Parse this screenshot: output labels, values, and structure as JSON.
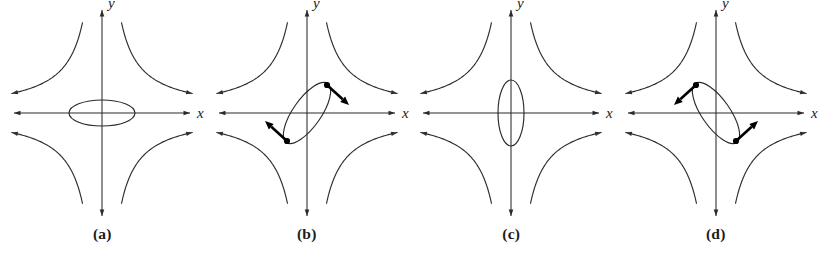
{
  "figure": {
    "kind": "phase-portrait-figure",
    "panel_count": 4,
    "background_color": "#ffffff",
    "stroke_color": "#2a2a2a",
    "accent_color": "#000000",
    "axis_label_x": "x",
    "axis_label_y": "y",
    "geometry": {
      "origin_x": 102,
      "origin_y": 113,
      "x_axis_half_length": 88,
      "y_axis_half_length": 103,
      "saddle_curve_scale": 42,
      "saddle_curve_extent": 2.15
    }
  },
  "panels": [
    {
      "id": "panel-a",
      "caption": "(a)",
      "ellipse": {
        "center_x": 0,
        "center_y": 0,
        "semi_major": 33,
        "semi_minor": 13,
        "rotation_deg": 0,
        "orientation": "horizontal"
      },
      "saddle_curves": true,
      "vectors": []
    },
    {
      "id": "panel-b",
      "caption": "(b)",
      "ellipse": {
        "center_x": 0,
        "center_y": 0,
        "semi_major": 36,
        "semi_minor": 14,
        "rotation_deg": -55,
        "orientation": "tilted-up-right"
      },
      "saddle_curves": true,
      "vectors": [
        {
          "name": "vector-upper-right",
          "point_x": 20,
          "point_y": 28,
          "dx": 22,
          "dy": -20,
          "direction": "down-right"
        },
        {
          "name": "vector-lower-left",
          "point_x": -20,
          "point_y": -28,
          "dx": -22,
          "dy": 20,
          "direction": "up-left"
        }
      ]
    },
    {
      "id": "panel-c",
      "caption": "(c)",
      "ellipse": {
        "center_x": 0,
        "center_y": 0,
        "semi_major": 33,
        "semi_minor": 13,
        "rotation_deg": 90,
        "orientation": "vertical"
      },
      "saddle_curves": true,
      "vectors": []
    },
    {
      "id": "panel-d",
      "caption": "(d)",
      "ellipse": {
        "center_x": 0,
        "center_y": 0,
        "semi_major": 36,
        "semi_minor": 14,
        "rotation_deg": 55,
        "orientation": "tilted-down-right"
      },
      "saddle_curves": true,
      "vectors": [
        {
          "name": "vector-upper-left",
          "point_x": -20,
          "point_y": 28,
          "dx": -22,
          "dy": -20,
          "direction": "down-left"
        },
        {
          "name": "vector-lower-right",
          "point_x": 20,
          "point_y": -28,
          "dx": 22,
          "dy": 20,
          "direction": "up-right"
        }
      ]
    }
  ],
  "chart_data": {
    "type": "scatter",
    "title": "",
    "xlabel": "x",
    "ylabel": "y",
    "subplots": [
      {
        "label": "(a)",
        "description": "Saddle-type separatrix curves in four quadrants with a horizontal ellipse centered at the origin",
        "ellipse_semi_axes": [
          33,
          13
        ],
        "ellipse_rotation_deg": 0,
        "arrow_vectors": []
      },
      {
        "label": "(b)",
        "description": "Saddle-type separatrix curves with an ellipse tilted so its major axis runs up-to-the-right; two marked points carry outward arrows",
        "ellipse_semi_axes": [
          36,
          14
        ],
        "ellipse_rotation_deg": -55,
        "arrow_vectors": [
          {
            "at": [
              20,
              28
            ],
            "vector": [
              22,
              -20
            ]
          },
          {
            "at": [
              -20,
              -28
            ],
            "vector": [
              -22,
              20
            ]
          }
        ]
      },
      {
        "label": "(c)",
        "description": "Saddle-type separatrix curves in four quadrants with a vertical ellipse centered at the origin",
        "ellipse_semi_axes": [
          33,
          13
        ],
        "ellipse_rotation_deg": 90,
        "arrow_vectors": []
      },
      {
        "label": "(d)",
        "description": "Saddle-type separatrix curves with an ellipse tilted so its major axis runs down-to-the-right; two marked points carry outward arrows",
        "ellipse_semi_axes": [
          36,
          14
        ],
        "ellipse_rotation_deg": 55,
        "arrow_vectors": [
          {
            "at": [
              -20,
              28
            ],
            "vector": [
              -22,
              -20
            ]
          },
          {
            "at": [
              20,
              -28
            ],
            "vector": [
              22,
              20
            ]
          }
        ]
      }
    ],
    "grid": false,
    "legend": "none"
  }
}
